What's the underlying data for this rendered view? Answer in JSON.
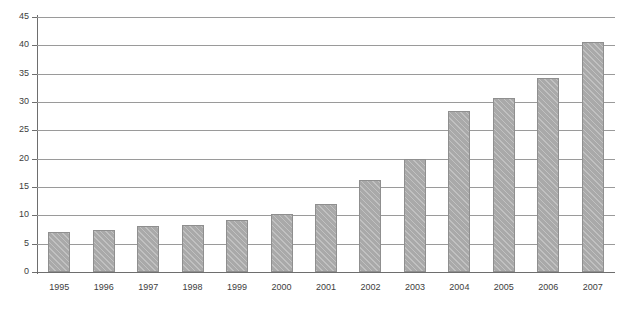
{
  "chart_data": {
    "type": "bar",
    "title": "",
    "xlabel": "",
    "ylabel": "",
    "categories": [
      "1995",
      "1996",
      "1997",
      "1998",
      "1999",
      "2000",
      "2001",
      "2002",
      "2003",
      "2004",
      "2005",
      "2006",
      "2007"
    ],
    "values": [
      7.0,
      7.4,
      8.1,
      8.3,
      9.1,
      10.3,
      12.0,
      16.2,
      19.9,
      28.4,
      30.7,
      34.2,
      40.6
    ],
    "ylim": [
      0,
      45
    ],
    "yticks": [
      0,
      5,
      10,
      15,
      20,
      25,
      30,
      35,
      40,
      45
    ],
    "ytick_labels": [
      "0",
      "5",
      "10",
      "15",
      "20",
      "25",
      "30",
      "35",
      "40",
      "45"
    ],
    "grid": true,
    "legend": false,
    "series": [
      {
        "name": "Series 1",
        "values": [
          7.0,
          7.4,
          8.1,
          8.3,
          9.1,
          10.3,
          12.0,
          16.2,
          19.9,
          28.4,
          30.7,
          34.2,
          40.6
        ]
      }
    ]
  },
  "style": {
    "bar_fill": "#a9a9a9",
    "bar_border": "#8f8f8f",
    "gridline_color": "#9a9a9a",
    "axis_color": "#6e6e6e",
    "text_color": "#3d3d3d",
    "background": "#ffffff"
  }
}
